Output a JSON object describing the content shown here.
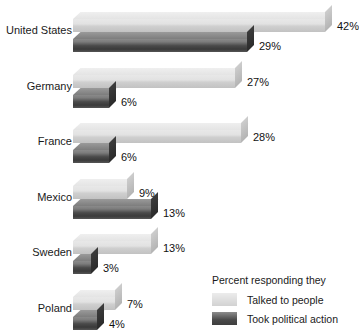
{
  "chart_data": {
    "type": "bar",
    "orientation": "horizontal",
    "title": "",
    "xlabel": "",
    "ylabel": "",
    "categories": [
      "United States",
      "Germany",
      "France",
      "Mexico",
      "Sweden",
      "Poland"
    ],
    "series": [
      {
        "name": "Talked to people",
        "values": [
          42,
          27,
          28,
          9,
          13,
          7
        ],
        "labels": [
          "42%",
          "27%",
          "28%",
          "9%",
          "13%",
          "7%"
        ],
        "color": "#dcdcdc"
      },
      {
        "name": "Took political action",
        "values": [
          29,
          6,
          6,
          13,
          3,
          4
        ],
        "labels": [
          "29%",
          "6%",
          "6%",
          "13%",
          "3%",
          "4%"
        ],
        "color": "#4a4a4a"
      }
    ],
    "value_suffix": "%",
    "xlim": [
      0,
      42
    ],
    "grid": false,
    "legend_position": "bottom-right",
    "legend_title": "Percent responding they",
    "style": "3d"
  },
  "legend": {
    "title": "Percent responding they",
    "entries": [
      {
        "label": "Talked to people",
        "swatch": "light"
      },
      {
        "label": "Took political action",
        "swatch": "dark"
      }
    ]
  }
}
